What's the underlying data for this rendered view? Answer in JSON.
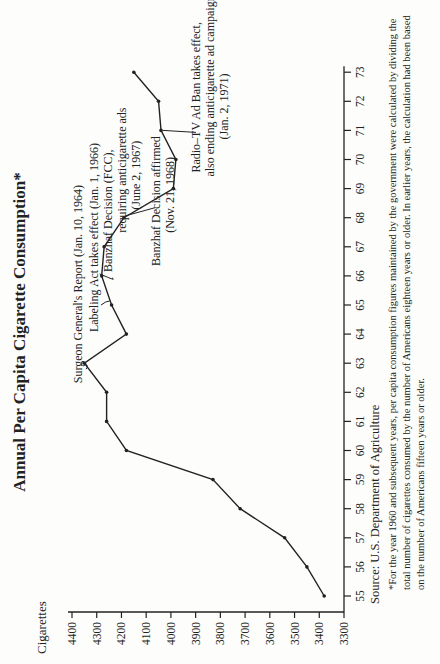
{
  "title": "Annual Per Capita Cigarette Consumption*",
  "y_axis_title": "Cigarettes",
  "source": "Source: U.S. Department of Agriculture",
  "footnote": "*For the year 1960 and subsequent years, per capita consumption figures maintained by the government were calculated by dividing the total number of cigarettes consumed by the number of Americans eighteen years or older. In earlier years, the calculation had been based on the number of Americans fifteen years or older.",
  "chart_data": {
    "type": "line",
    "title": "Annual Per Capita Cigarette Consumption*",
    "xlabel": "",
    "ylabel": "Cigarettes",
    "x": [
      "55",
      "56",
      "57",
      "58",
      "59",
      "60",
      "61",
      "62",
      "63",
      "64",
      "65",
      "66",
      "67",
      "68",
      "69",
      "70",
      "71",
      "72",
      "73"
    ],
    "values": [
      3380,
      3450,
      3540,
      3720,
      3830,
      4180,
      4260,
      4260,
      4350,
      4180,
      4240,
      4280,
      4270,
      4190,
      3990,
      3980,
      4040,
      4050,
      4150
    ],
    "yticks": [
      3300,
      3400,
      3500,
      3600,
      3700,
      3800,
      3900,
      4000,
      4100,
      4200,
      4300,
      4400
    ],
    "ylim": [
      3300,
      4400
    ],
    "grid": false,
    "annotations": [
      {
        "year": "63",
        "text": "Surgeon General's Report (Jan. 10, 1964)"
      },
      {
        "year": "65",
        "text": "Labeling Act takes effect (Jan. 1, 1966)"
      },
      {
        "year": "66",
        "text": "Banzhaf Decision (FCC), requiring anticigarette ads (June 2, 1967)"
      },
      {
        "year": "68",
        "text": "Banzhaf Decision affirmed (Nov. 21, 1968)"
      },
      {
        "year": "70",
        "text": "Radio–TV Ad Ban takes effect, also ending anticigarette ad campaign (Jan. 2, 1971)"
      }
    ]
  }
}
